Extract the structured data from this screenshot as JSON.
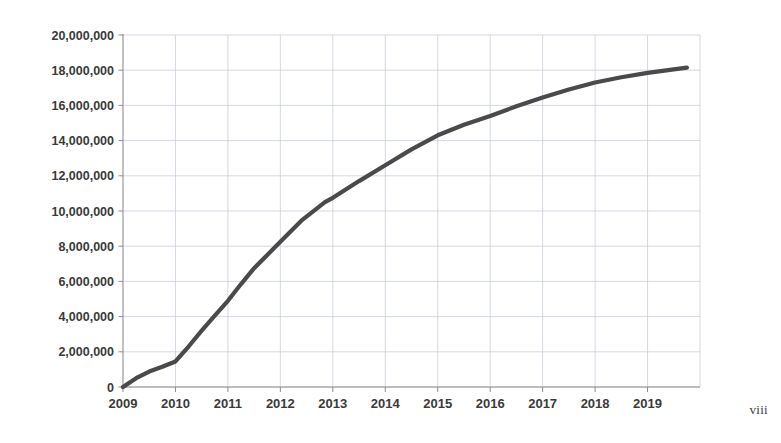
{
  "page": {
    "folio": "viii",
    "background_color": "#ffffff"
  },
  "chart_data": {
    "type": "line",
    "title": "",
    "subtitle": "",
    "xlabel": "",
    "ylabel": "",
    "grid": true,
    "legend": null,
    "legend_position": "none",
    "line_color": "#4a4a4a",
    "grid_color": "#c9cfdc",
    "axis_color": "#8d8d8d",
    "xlim": [
      2009,
      2020
    ],
    "ylim": [
      0,
      20000000
    ],
    "x_tick_labels": [
      "2009",
      "2010",
      "2011",
      "2012",
      "2013",
      "2014",
      "2015",
      "2016",
      "2017",
      "2018",
      "2019"
    ],
    "x_tick_values": [
      2009,
      2010,
      2011,
      2012,
      2013,
      2014,
      2015,
      2016,
      2017,
      2018,
      2019
    ],
    "y_tick_labels": [
      "20,000,000",
      "18,000,000",
      "16,000,000",
      "14,000,000",
      "12,000,000",
      "10,000,000",
      "8,000,000",
      "6,000,000",
      "4,000,000",
      "2,000,000",
      "0"
    ],
    "y_tick_values": [
      20000000,
      18000000,
      16000000,
      14000000,
      12000000,
      10000000,
      8000000,
      6000000,
      4000000,
      2000000,
      0
    ],
    "series": [
      {
        "name": "cumulative total",
        "x": [
          2009.0,
          2009.25,
          2009.5,
          2009.75,
          2010.0,
          2010.25,
          2010.5,
          2010.75,
          2011.0,
          2011.25,
          2011.5,
          2011.75,
          2012.0,
          2012.4,
          2012.85,
          2013.0,
          2013.5,
          2014.0,
          2014.5,
          2015.0,
          2015.5,
          2016.0,
          2016.5,
          2017.0,
          2017.5,
          2018.0,
          2018.5,
          2019.0,
          2019.75
        ],
        "values": [
          0,
          500000,
          880000,
          1150000,
          1450000,
          2300000,
          3200000,
          4050000,
          4900000,
          5850000,
          6750000,
          7500000,
          8250000,
          9450000,
          10500000,
          10750000,
          11700000,
          12600000,
          13500000,
          14300000,
          14900000,
          15400000,
          15950000,
          16450000,
          16900000,
          17300000,
          17600000,
          17850000,
          18150000
        ]
      }
    ]
  }
}
